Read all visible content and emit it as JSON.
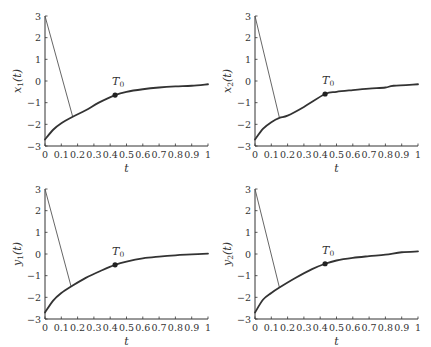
{
  "chart_data": [
    {
      "type": "line",
      "title": "",
      "xlabel": "t",
      "ylabel": "x_1(t)",
      "ylabel_main": "x",
      "ylabel_sub": "1",
      "xlim": [
        0,
        1
      ],
      "ylim": [
        -3,
        3
      ],
      "xticks": [
        "0",
        "0.1",
        "0.2",
        "0.3",
        "0.4",
        "0.5",
        "0.6",
        "0.7",
        "0.8",
        "0.9",
        "1"
      ],
      "yticks": [
        "3",
        "2",
        "1",
        "0",
        "-1",
        "-2",
        "-3"
      ],
      "grid": false,
      "series": [
        {
          "name": "initial transient",
          "style": "thin",
          "x": [
            0,
            0.17
          ],
          "y": [
            3,
            -1.65
          ]
        },
        {
          "name": "trajectory",
          "style": "thick",
          "x": [
            0,
            0.05,
            0.1,
            0.17,
            0.25,
            0.33,
            0.43,
            0.5,
            0.6,
            0.7,
            0.8,
            0.9,
            1.0
          ],
          "y": [
            -2.7,
            -2.25,
            -1.95,
            -1.65,
            -1.35,
            -1.0,
            -0.65,
            -0.5,
            -0.38,
            -0.3,
            -0.25,
            -0.22,
            -0.15
          ]
        }
      ],
      "annotations": [
        {
          "text": "T_0",
          "main": "T",
          "sub": "0",
          "x": 0.43,
          "y": -0.65
        }
      ]
    },
    {
      "type": "line",
      "title": "",
      "xlabel": "t",
      "ylabel": "x_2(t)",
      "ylabel_main": "x",
      "ylabel_sub": "2",
      "xlim": [
        0,
        1
      ],
      "ylim": [
        -3,
        3
      ],
      "xticks": [
        "0",
        "0.1",
        "0.2",
        "0.3",
        "0.4",
        "0.5",
        "0.6",
        "0.7",
        "0.8",
        "0.9",
        "1"
      ],
      "yticks": [
        "3",
        "2",
        "1",
        "0",
        "-1",
        "-2",
        "-3"
      ],
      "grid": false,
      "series": [
        {
          "name": "initial transient",
          "style": "thin",
          "x": [
            0,
            0.15
          ],
          "y": [
            3,
            -1.7
          ]
        },
        {
          "name": "trajectory",
          "style": "thick",
          "x": [
            0,
            0.05,
            0.1,
            0.15,
            0.2,
            0.3,
            0.43,
            0.5,
            0.6,
            0.7,
            0.8,
            0.85,
            1.0
          ],
          "y": [
            -2.7,
            -2.2,
            -1.9,
            -1.7,
            -1.6,
            -1.2,
            -0.6,
            -0.5,
            -0.42,
            -0.35,
            -0.3,
            -0.22,
            -0.15
          ]
        }
      ],
      "annotations": [
        {
          "text": "T_0",
          "main": "T",
          "sub": "0",
          "x": 0.43,
          "y": -0.6
        }
      ]
    },
    {
      "type": "line",
      "title": "",
      "xlabel": "t",
      "ylabel": "y_1(t)",
      "ylabel_main": "y",
      "ylabel_sub": "1",
      "xlim": [
        0,
        1
      ],
      "ylim": [
        -3,
        3
      ],
      "xticks": [
        "0",
        "0.1",
        "0.2",
        "0.3",
        "0.4",
        "0.5",
        "0.6",
        "0.7",
        "0.8",
        "0.9",
        "1"
      ],
      "yticks": [
        "3",
        "2",
        "1",
        "0",
        "-1",
        "-2",
        "-3"
      ],
      "grid": false,
      "series": [
        {
          "name": "initial transient",
          "style": "thin",
          "x": [
            0,
            0.16
          ],
          "y": [
            3,
            -1.5
          ]
        },
        {
          "name": "trajectory",
          "style": "thick",
          "x": [
            0,
            0.05,
            0.1,
            0.16,
            0.25,
            0.35,
            0.43,
            0.5,
            0.6,
            0.7,
            0.8,
            0.9,
            1.0
          ],
          "y": [
            -2.7,
            -2.15,
            -1.8,
            -1.5,
            -1.1,
            -0.75,
            -0.5,
            -0.35,
            -0.2,
            -0.12,
            -0.06,
            -0.02,
            0.02
          ]
        }
      ],
      "annotations": [
        {
          "text": "T_0",
          "main": "T",
          "sub": "0",
          "x": 0.43,
          "y": -0.5
        }
      ]
    },
    {
      "type": "line",
      "title": "",
      "xlabel": "t",
      "ylabel": "y_2(t)",
      "ylabel_main": "y",
      "ylabel_sub": "2",
      "xlim": [
        0,
        1
      ],
      "ylim": [
        -3,
        3
      ],
      "xticks": [
        "0",
        "0.1",
        "0.2",
        "0.3",
        "0.4",
        "0.5",
        "0.6",
        "0.7",
        "0.8",
        "0.9",
        "1"
      ],
      "yticks": [
        "3",
        "2",
        "1",
        "0",
        "-1",
        "-2",
        "-3"
      ],
      "grid": false,
      "series": [
        {
          "name": "initial transient",
          "style": "thin",
          "x": [
            0,
            0.15
          ],
          "y": [
            3,
            -1.55
          ]
        },
        {
          "name": "trajectory",
          "style": "thick",
          "x": [
            0,
            0.05,
            0.1,
            0.15,
            0.25,
            0.35,
            0.43,
            0.5,
            0.6,
            0.7,
            0.8,
            0.9,
            1.0
          ],
          "y": [
            -2.7,
            -2.1,
            -1.8,
            -1.55,
            -1.1,
            -0.7,
            -0.45,
            -0.3,
            -0.18,
            -0.1,
            -0.03,
            0.08,
            0.12
          ]
        }
      ],
      "annotations": [
        {
          "text": "T_0",
          "main": "T",
          "sub": "0",
          "x": 0.43,
          "y": -0.45
        }
      ]
    }
  ]
}
